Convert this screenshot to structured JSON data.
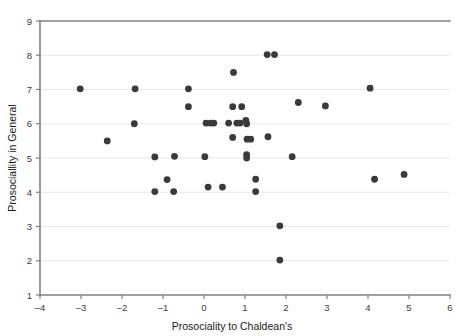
{
  "chart_data": {
    "type": "scatter",
    "title": "",
    "xlabel": "Prosociality to Chaldean's",
    "ylabel": "Prosociallity in General",
    "xlim": [
      -4,
      6
    ],
    "ylim": [
      1,
      9
    ],
    "xticks": [
      -4,
      -3,
      -2,
      -1,
      0,
      1,
      2,
      3,
      4,
      5,
      6
    ],
    "xtick_labels": [
      "–4",
      "–3",
      "–2",
      "–1",
      "0",
      "1",
      "2",
      "3",
      "4",
      "5",
      "6"
    ],
    "yticks": [
      1,
      2,
      3,
      4,
      5,
      6,
      7,
      8,
      9
    ],
    "ytick_labels": [
      "1",
      "2",
      "3",
      "4",
      "5",
      "6",
      "7",
      "8",
      "9"
    ],
    "grid": "horizontal",
    "grid_color": "#e8e8e8",
    "axis_color": "#808080",
    "marker_color": "#3a3a3a",
    "marker_size": 3.4,
    "legend": null,
    "points": [
      {
        "x": -3.02,
        "y": 7.02
      },
      {
        "x": -2.36,
        "y": 5.5
      },
      {
        "x": -1.68,
        "y": 7.02
      },
      {
        "x": -1.7,
        "y": 6.0
      },
      {
        "x": -1.2,
        "y": 5.03
      },
      {
        "x": -1.2,
        "y": 4.02
      },
      {
        "x": -0.9,
        "y": 4.37
      },
      {
        "x": -0.72,
        "y": 5.05
      },
      {
        "x": -0.74,
        "y": 4.02
      },
      {
        "x": -0.38,
        "y": 7.02
      },
      {
        "x": -0.38,
        "y": 6.5
      },
      {
        "x": 0.05,
        "y": 6.02
      },
      {
        "x": 0.16,
        "y": 6.02
      },
      {
        "x": 0.24,
        "y": 6.02
      },
      {
        "x": 0.02,
        "y": 5.04
      },
      {
        "x": 0.1,
        "y": 4.15
      },
      {
        "x": 0.45,
        "y": 4.15
      },
      {
        "x": 0.6,
        "y": 6.02
      },
      {
        "x": 0.7,
        "y": 6.5
      },
      {
        "x": 0.72,
        "y": 7.5
      },
      {
        "x": 0.7,
        "y": 5.6
      },
      {
        "x": 0.8,
        "y": 6.02
      },
      {
        "x": 0.88,
        "y": 6.02
      },
      {
        "x": 0.92,
        "y": 6.5
      },
      {
        "x": 1.02,
        "y": 6.1
      },
      {
        "x": 1.04,
        "y": 6.0
      },
      {
        "x": 1.05,
        "y": 5.55
      },
      {
        "x": 1.14,
        "y": 5.55
      },
      {
        "x": 1.04,
        "y": 5.1
      },
      {
        "x": 1.04,
        "y": 5.0
      },
      {
        "x": 1.26,
        "y": 4.38
      },
      {
        "x": 1.26,
        "y": 4.02
      },
      {
        "x": 1.54,
        "y": 8.02
      },
      {
        "x": 1.72,
        "y": 8.02
      },
      {
        "x": 1.56,
        "y": 5.62
      },
      {
        "x": 1.85,
        "y": 3.02
      },
      {
        "x": 1.85,
        "y": 2.02
      },
      {
        "x": 2.15,
        "y": 5.04
      },
      {
        "x": 2.3,
        "y": 6.62
      },
      {
        "x": 2.96,
        "y": 6.52
      },
      {
        "x": 4.05,
        "y": 7.04
      },
      {
        "x": 4.16,
        "y": 4.38
      },
      {
        "x": 4.88,
        "y": 4.52
      }
    ]
  }
}
